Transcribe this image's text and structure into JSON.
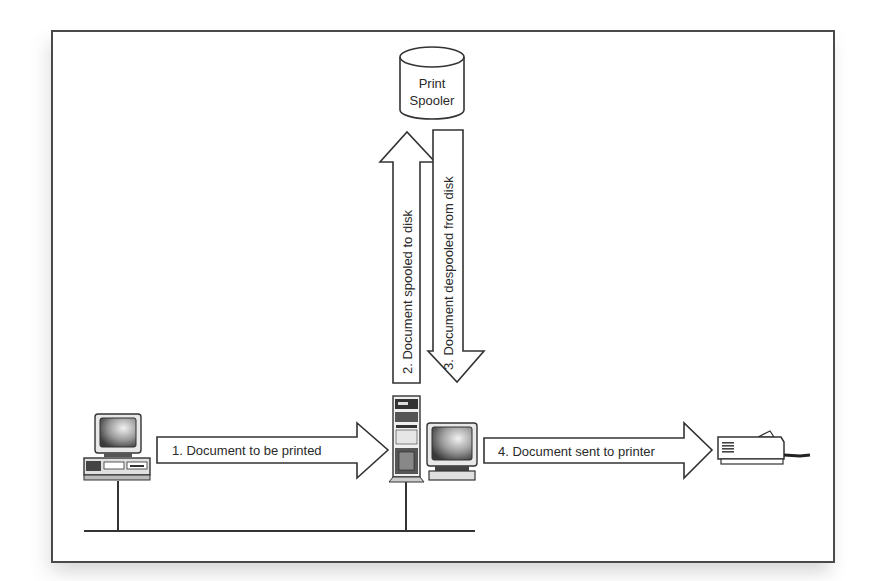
{
  "diagram": {
    "nodes": {
      "spooler": {
        "line1": "Print",
        "line2": "Spooler",
        "icon": "database-cylinder-icon"
      },
      "client": {
        "icon": "desktop-computer-icon"
      },
      "server": {
        "icon": "tower-server-with-monitor-icon"
      },
      "printer": {
        "icon": "printer-icon"
      }
    },
    "arrows": [
      {
        "label": "1. Document to be printed",
        "direction": "right",
        "from": "client",
        "to": "server"
      },
      {
        "label": "2. Document spooled to disk",
        "direction": "up",
        "from": "server",
        "to": "spooler"
      },
      {
        "label": "3. Document despooled from disk",
        "direction": "down",
        "from": "spooler",
        "to": "server"
      },
      {
        "label": "4. Document sent to printer",
        "direction": "right",
        "from": "server",
        "to": "printer"
      }
    ],
    "network": {
      "type": "bus",
      "connects": [
        "client",
        "server"
      ]
    },
    "colors": {
      "stroke": "#333333",
      "fill": "#ffffff",
      "shadow": "#bdbdbd"
    }
  }
}
